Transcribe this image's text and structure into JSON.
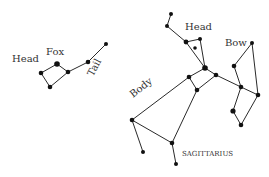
{
  "colors": {
    "line": "#2a2a2a",
    "star": "#111111",
    "text": "#333333",
    "background": "#ffffff"
  },
  "constellations": [
    {
      "name": "Fox",
      "labels": [
        {
          "text": "Head",
          "x": 12,
          "y": 62,
          "size": 10,
          "rotate": 0
        },
        {
          "text": "Fox",
          "x": 46,
          "y": 55,
          "size": 10,
          "rotate": 0
        },
        {
          "text": "Tail",
          "x": 93,
          "y": 77,
          "size": 10,
          "rotate": -62
        }
      ],
      "stars": [
        {
          "x": 41,
          "y": 73,
          "r": 2.3
        },
        {
          "x": 57,
          "y": 64,
          "r": 2.8
        },
        {
          "x": 68,
          "y": 72,
          "r": 2.3
        },
        {
          "x": 50,
          "y": 87,
          "r": 2.3
        },
        {
          "x": 88,
          "y": 62,
          "r": 2.3
        },
        {
          "x": 106,
          "y": 44,
          "r": 2.0
        }
      ],
      "edges": [
        [
          0,
          1
        ],
        [
          1,
          2
        ],
        [
          0,
          3
        ],
        [
          3,
          2
        ],
        [
          2,
          4
        ],
        [
          4,
          5
        ]
      ]
    },
    {
      "name": "SAGITTARIUS",
      "labels": [
        {
          "text": "Head",
          "x": 185,
          "y": 30,
          "size": 10,
          "rotate": 0
        },
        {
          "text": "Bow",
          "x": 225,
          "y": 46,
          "size": 10,
          "rotate": 0
        },
        {
          "text": "Body",
          "x": 133,
          "y": 98,
          "size": 10,
          "rotate": -38
        },
        {
          "text": "SAGITTARIUS",
          "x": 182,
          "y": 156,
          "size": 7,
          "rotate": 0
        }
      ],
      "stars": [
        {
          "x": 171,
          "y": 14,
          "r": 2.0
        },
        {
          "x": 167,
          "y": 26,
          "r": 2.0
        },
        {
          "x": 186,
          "y": 42,
          "r": 2.4
        },
        {
          "x": 200,
          "y": 39,
          "r": 2.0
        },
        {
          "x": 195,
          "y": 48,
          "r": 1.8
        },
        {
          "x": 205,
          "y": 68,
          "r": 2.8
        },
        {
          "x": 189,
          "y": 77,
          "r": 2.3
        },
        {
          "x": 216,
          "y": 75,
          "r": 2.3
        },
        {
          "x": 197,
          "y": 90,
          "r": 2.3
        },
        {
          "x": 241,
          "y": 87,
          "r": 2.3
        },
        {
          "x": 258,
          "y": 95,
          "r": 2.3
        },
        {
          "x": 234,
          "y": 66,
          "r": 2.3
        },
        {
          "x": 252,
          "y": 43,
          "r": 2.0
        },
        {
          "x": 233,
          "y": 111,
          "r": 2.6
        },
        {
          "x": 241,
          "y": 125,
          "r": 2.3
        },
        {
          "x": 132,
          "y": 120,
          "r": 2.3
        },
        {
          "x": 143,
          "y": 152,
          "r": 2.0
        },
        {
          "x": 172,
          "y": 143,
          "r": 2.3
        },
        {
          "x": 176,
          "y": 164,
          "r": 2.0
        }
      ],
      "edges": [
        [
          0,
          1
        ],
        [
          1,
          2
        ],
        [
          2,
          3
        ],
        [
          2,
          5
        ],
        [
          3,
          5
        ],
        [
          5,
          6
        ],
        [
          5,
          7
        ],
        [
          6,
          8
        ],
        [
          7,
          8
        ],
        [
          7,
          9
        ],
        [
          9,
          10
        ],
        [
          9,
          11
        ],
        [
          11,
          12
        ],
        [
          12,
          10
        ],
        [
          10,
          14
        ],
        [
          9,
          13
        ],
        [
          13,
          14
        ],
        [
          6,
          15
        ],
        [
          15,
          16
        ],
        [
          15,
          17
        ],
        [
          8,
          17
        ],
        [
          17,
          18
        ]
      ]
    }
  ]
}
